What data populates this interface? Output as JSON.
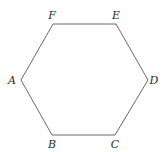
{
  "diagram": {
    "type": "hexagon",
    "stroke_color": "#6a6a6a",
    "label_color": "#2a2a2a",
    "vertices": [
      {
        "label": "A",
        "x": 21,
        "y": 80,
        "lx": 12,
        "ly": 84,
        "anchor": "middle"
      },
      {
        "label": "B",
        "x": 52,
        "y": 135,
        "lx": 52,
        "ly": 148,
        "anchor": "middle"
      },
      {
        "label": "C",
        "x": 115,
        "y": 135,
        "lx": 115,
        "ly": 148,
        "anchor": "middle"
      },
      {
        "label": "D",
        "x": 148,
        "y": 80,
        "lx": 154,
        "ly": 84,
        "anchor": "middle"
      },
      {
        "label": "E",
        "x": 116,
        "y": 24,
        "lx": 116,
        "ly": 19,
        "anchor": "middle"
      },
      {
        "label": "F",
        "x": 53,
        "y": 24,
        "lx": 52,
        "ly": 19,
        "anchor": "middle"
      }
    ]
  }
}
